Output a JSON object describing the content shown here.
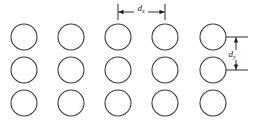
{
  "figure": {
    "background_color": "#ffffff",
    "stroke_color": "#3a3a3a",
    "dimension_color": "#1a1a1a",
    "text_color": "#1a1a1a"
  },
  "grid": {
    "columns": 5,
    "rows": 3,
    "circle_diameter": 26,
    "circle_radius": 13,
    "stroke_width": 1.1,
    "column_centers_x": [
      24,
      71,
      118,
      165,
      213
    ],
    "row_centers_y": [
      37,
      70,
      103
    ],
    "circles": [
      {
        "id": "r1c1",
        "cx": 24,
        "cy": 37
      },
      {
        "id": "r1c2",
        "cx": 71,
        "cy": 37
      },
      {
        "id": "r1c3",
        "cx": 118,
        "cy": 37
      },
      {
        "id": "r1c4",
        "cx": 165,
        "cy": 37
      },
      {
        "id": "r1c5",
        "cx": 213,
        "cy": 37
      },
      {
        "id": "r2c1",
        "cx": 24,
        "cy": 70
      },
      {
        "id": "r2c2",
        "cx": 71,
        "cy": 70
      },
      {
        "id": "r2c3",
        "cx": 118,
        "cy": 70
      },
      {
        "id": "r2c4",
        "cx": 165,
        "cy": 70
      },
      {
        "id": "r2c5",
        "cx": 213,
        "cy": 70
      },
      {
        "id": "r3c1",
        "cx": 24,
        "cy": 103
      },
      {
        "id": "r3c2",
        "cx": 71,
        "cy": 103
      },
      {
        "id": "r3c3",
        "cx": 118,
        "cy": 103
      },
      {
        "id": "r3c4",
        "cx": 165,
        "cy": 103
      },
      {
        "id": "r3c5",
        "cx": 213,
        "cy": 103
      }
    ]
  },
  "dimensions": {
    "horizontal": {
      "symbol": "d",
      "subscript": "x",
      "orientation": "horizontal",
      "line_y": 12,
      "start_x": 118,
      "end_x": 165,
      "tick_top_y": 4,
      "tick_bottom_y": 20,
      "label_x": 141,
      "label_y": 11,
      "measures": "center-to-center column pitch"
    },
    "vertical": {
      "symbol": "d",
      "subscript": "y",
      "orientation": "vertical",
      "line_x": 236,
      "start_y": 37,
      "end_y": 70,
      "tick_left_x": 226,
      "tick_right_x": 248,
      "label_x": 232,
      "label_y": 57,
      "measures": "center-to-center row pitch"
    }
  }
}
